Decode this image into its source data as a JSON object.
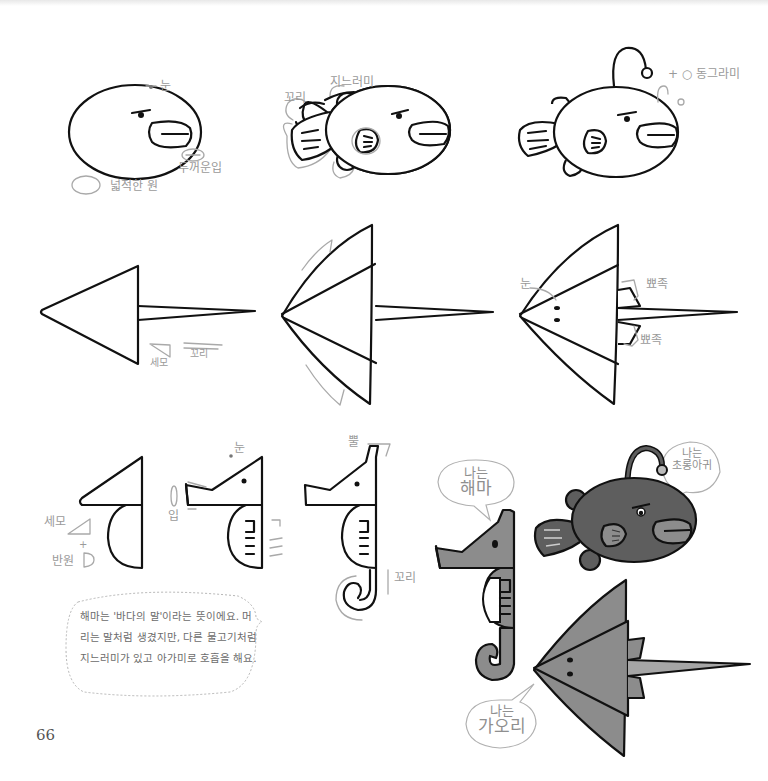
{
  "page": {
    "number": "66",
    "colors": {
      "ink": "#111111",
      "label_gray": "#9a9a9a",
      "fill_dark": "#5a5a5a",
      "fill_mid": "#8a8a8a",
      "fill_light": "#a8a8a8"
    }
  },
  "anglerfish_steps": {
    "step1": {
      "label_eye": "눈",
      "label_lips": "두꺼운입",
      "label_body": "넓적한 원"
    },
    "step2": {
      "label_tail": "꼬리",
      "label_fin": "지느러미"
    },
    "step3": {
      "label_lure": "+ ○ 동그라미"
    }
  },
  "stingray_steps": {
    "step1": {
      "label_triangle": "세모",
      "label_tail": "꼬리"
    },
    "step3": {
      "label_eye": "눈",
      "label_fin_top": "뾰족",
      "label_fin_bottom": "뾰족"
    }
  },
  "seahorse_steps": {
    "step1": {
      "label_triangle": "세모",
      "label_plus": "+",
      "label_semicircle": "반원"
    },
    "step2": {
      "label_eye": "눈",
      "label_mouth": "입"
    },
    "step3": {
      "label_horn": "뿔",
      "label_tail": "꼬리"
    }
  },
  "info_note": {
    "text": "해마는 '바다의 말'이라는 뜻이에요. 머리는 말처럼 생겼지만, 다른 물고기처럼 지느러미가 있고 아가미로 호흡을 해요."
  },
  "speech_bubbles": {
    "seahorse": {
      "line1": "나는",
      "line2": "해마"
    },
    "anglerfish": {
      "line1": "나는",
      "line2": "초롱아귀"
    },
    "stingray": {
      "line1": "나는",
      "line2": "가오리"
    }
  }
}
